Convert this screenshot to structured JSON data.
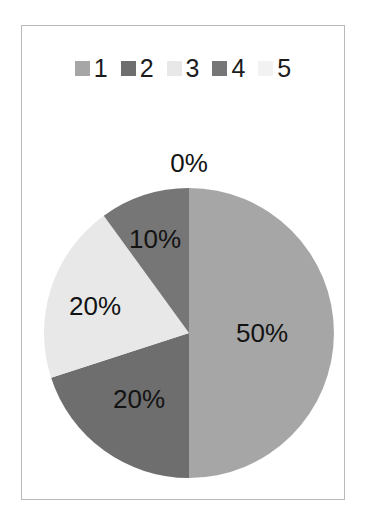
{
  "chart_data": {
    "type": "pie",
    "title": "",
    "categories": [
      "1",
      "2",
      "3",
      "4",
      "5"
    ],
    "values": [
      50,
      20,
      20,
      10,
      0
    ],
    "value_labels": [
      "50%",
      "20%",
      "20%",
      "10%",
      "0%"
    ],
    "units": "percent",
    "start_angle_deg": 0,
    "direction": "clockwise",
    "legend": {
      "position": "top",
      "entries": [
        {
          "label": "1",
          "color": "#a6a6a6"
        },
        {
          "label": "2",
          "color": "#6e6e6e"
        },
        {
          "label": "3",
          "color": "#e8e8e8"
        },
        {
          "label": "4",
          "color": "#767676"
        },
        {
          "label": "5",
          "color": "#f2f2f2"
        }
      ]
    },
    "slices": [
      {
        "name": "1",
        "value": 50,
        "label": "50%",
        "color": "#a6a6a6",
        "label_x": 240,
        "label_y": 207
      },
      {
        "name": "2",
        "value": 20,
        "label": "20%",
        "color": "#6e6e6e",
        "label_x": 117,
        "label_y": 273
      },
      {
        "name": "3",
        "value": 20,
        "label": "20%",
        "color": "#e8e8e8",
        "label_x": 73,
        "label_y": 180
      },
      {
        "name": "4",
        "value": 10,
        "label": "10%",
        "color": "#767676",
        "label_x": 133,
        "label_y": 113
      },
      {
        "name": "5",
        "value": 0,
        "label": "0%",
        "color": "#f2f2f2",
        "label_x": 167,
        "label_y": 37
      }
    ],
    "grid": false,
    "xlabel": "",
    "ylabel": ""
  },
  "frame": {
    "border_color": "#b9b9b9",
    "background": "#ffffff"
  }
}
